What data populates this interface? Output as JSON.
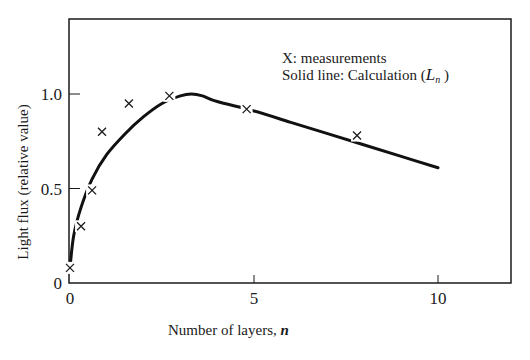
{
  "chart_data": {
    "type": "line",
    "title": "",
    "xlabel": "Number of layers,",
    "xlabel_var": "n",
    "ylabel": "Light flux (relative value)",
    "xlim": [
      0,
      12
    ],
    "ylim": [
      0,
      1.4
    ],
    "x_ticks": [
      0,
      5,
      10
    ],
    "x_tick_labels": [
      "0",
      "5",
      "10"
    ],
    "y_ticks": [
      0,
      0.5,
      1.0
    ],
    "y_tick_labels": [
      "0",
      "0.5",
      "1.0"
    ],
    "grid": false,
    "legend": {
      "position": "upper right (inside)",
      "entries": [
        "X: measurements",
        "Solid line: Calculation"
      ],
      "calc_symbol": "L",
      "calc_subscript": "n"
    },
    "series": [
      {
        "name": "measurements",
        "style": "x-markers",
        "x": [
          0.0,
          0.3,
          0.6,
          0.87,
          1.6,
          2.7,
          4.8,
          7.8
        ],
        "y": [
          0.08,
          0.3,
          0.49,
          0.8,
          0.95,
          0.99,
          0.92,
          0.78
        ]
      },
      {
        "name": "Calculation (Ln)",
        "style": "solid-line",
        "x": [
          0.0,
          0.1,
          0.3,
          0.6,
          1.0,
          1.5,
          2.0,
          2.5,
          3.0,
          3.3,
          3.6,
          4.0,
          5.0,
          6.0,
          7.0,
          8.0,
          9.0,
          10.0
        ],
        "y": [
          0.08,
          0.25,
          0.4,
          0.55,
          0.68,
          0.79,
          0.88,
          0.95,
          0.99,
          1.0,
          0.99,
          0.96,
          0.91,
          0.85,
          0.79,
          0.73,
          0.67,
          0.61
        ]
      }
    ]
  }
}
